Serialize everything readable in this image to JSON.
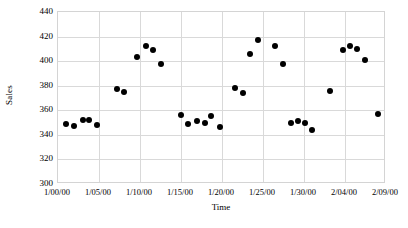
{
  "chart_data": {
    "type": "scatter",
    "title": "",
    "xlabel": "Time",
    "ylabel": "Sales",
    "ylim": [
      300,
      440
    ],
    "ytick_labels": [
      "440",
      "420",
      "400",
      "380",
      "360",
      "340",
      "320",
      "300"
    ],
    "ytick_values": [
      440,
      420,
      400,
      380,
      360,
      340,
      320,
      300
    ],
    "xtick_labels": [
      "1/00/00",
      "1/05/00",
      "1/10/00",
      "1/15/00",
      "1/20/00",
      "1/25/00",
      "1/30/00",
      "2/04/00",
      "2/09/00"
    ],
    "xtick_values": [
      0,
      5,
      10,
      15,
      20,
      25,
      30,
      35,
      40
    ],
    "xlim": [
      0,
      40
    ],
    "grid": true,
    "legend": false,
    "marker_color": "#000000",
    "grid_color": "#d9d9d9",
    "series": [
      {
        "name": "Sales",
        "x": [
          1.0,
          2.0,
          3.0,
          3.8,
          4.8,
          7.2,
          8.0,
          9.6,
          10.7,
          11.6,
          12.6,
          15.0,
          15.9,
          16.9,
          17.9,
          18.7,
          19.7,
          21.6,
          22.5,
          23.4,
          24.4,
          26.5,
          27.4,
          28.4,
          29.3,
          30.1,
          31.0,
          33.2,
          34.8,
          35.6,
          36.5,
          37.4,
          39.0
        ],
        "y": [
          349,
          347,
          352,
          352,
          348,
          377,
          375,
          403,
          412,
          409,
          398,
          356,
          349,
          351,
          350,
          355,
          346,
          378,
          374,
          406,
          417,
          412,
          398,
          350,
          351,
          350,
          344,
          376,
          409,
          412,
          410,
          401,
          357
        ]
      }
    ]
  }
}
